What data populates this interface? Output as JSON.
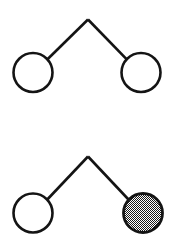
{
  "figure": {
    "background_color": "#ffffff",
    "stroke_color": "#141414",
    "fill_pattern_color": "#1a1a1a",
    "stroke_width": 2.6,
    "node_radius": 19.5,
    "canvas": {
      "width": 177,
      "height": 239
    }
  },
  "diagrams": [
    {
      "id": "diagram-top",
      "label": "Top diagram: two open nodes",
      "apex": {
        "x": 88,
        "y": 19.5
      },
      "nodes": [
        {
          "id": "node-top-left",
          "label": "Open node (left)",
          "fill_style": "none",
          "cx": 33,
          "cy": 72.5,
          "r": 19.5
        },
        {
          "id": "node-top-right",
          "label": "Open node (right)",
          "fill_style": "none",
          "cx": 141,
          "cy": 72.5,
          "r": 19.5
        }
      ],
      "edges": [
        {
          "id": "edge-top-left",
          "label": "Apex to left node",
          "x1": 88,
          "y1": 19.5,
          "x2": 47.5,
          "y2": 59.2
        },
        {
          "id": "edge-top-right",
          "label": "Apex to right node",
          "x1": 88,
          "y1": 19.5,
          "x2": 127,
          "y2": 59.7
        }
      ]
    },
    {
      "id": "diagram-bottom",
      "label": "Bottom diagram: open node and shaded node",
      "apex": {
        "x": 88,
        "y": 156.5
      },
      "nodes": [
        {
          "id": "node-bottom-left",
          "label": "Open node (left)",
          "fill_style": "none",
          "cx": 33,
          "cy": 213,
          "r": 19.5
        },
        {
          "id": "node-bottom-right",
          "label": "Shaded node (right)",
          "fill_style": "checker-dither",
          "cx": 143,
          "cy": 213,
          "r": 19.5
        }
      ],
      "edges": [
        {
          "id": "edge-bottom-left",
          "label": "Apex to left open node",
          "x1": 88,
          "y1": 156.5,
          "x2": 47.3,
          "y2": 199.5
        },
        {
          "id": "edge-bottom-right",
          "label": "Apex to shaded node",
          "x1": 88,
          "y1": 156.5,
          "x2": 128.5,
          "y2": 199.5
        }
      ]
    }
  ]
}
